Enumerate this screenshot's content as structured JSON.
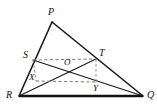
{
  "figure": {
    "background_color": "#ffffff",
    "stroke_color": "#1a1a1a",
    "dash_color": "#7a7a7a",
    "width": 157,
    "height": 105
  },
  "labels": {
    "P": "P",
    "Q": "Q",
    "R": "R",
    "S": "S",
    "T": "T",
    "O": "O",
    "X": "X",
    "Y": "Y"
  },
  "points": {
    "P": {
      "x": 52,
      "y": 22
    },
    "Q": {
      "x": 143,
      "y": 96
    },
    "R": {
      "x": 19,
      "y": 96
    },
    "S": {
      "x": 33,
      "y": 60
    },
    "T": {
      "x": 96,
      "y": 59
    },
    "O": {
      "x": 67,
      "y": 67
    },
    "X": {
      "x": 36,
      "y": 81
    },
    "Y": {
      "x": 96,
      "y": 82
    }
  },
  "label_positions": {
    "P": {
      "x": 48,
      "y": 15
    },
    "Q": {
      "x": 147,
      "y": 98
    },
    "R": {
      "x": 6,
      "y": 98
    },
    "S": {
      "x": 23,
      "y": 58
    },
    "T": {
      "x": 99,
      "y": 56
    },
    "O": {
      "x": 64,
      "y": 65
    },
    "X": {
      "x": 29,
      "y": 80
    },
    "Y": {
      "x": 93,
      "y": 91
    }
  },
  "segments": [
    {
      "name": "PR",
      "from": "P",
      "to": "R",
      "style": "solid"
    },
    {
      "name": "PQ",
      "from": "P",
      "to": "Q",
      "style": "solid"
    },
    {
      "name": "RQ",
      "from": "R",
      "to": "Q",
      "style": "base"
    },
    {
      "name": "RT",
      "from": "R",
      "to": "T",
      "style": "thin"
    },
    {
      "name": "SQ",
      "from": "S",
      "to": "Q",
      "style": "thin"
    },
    {
      "name": "ST",
      "from": "S",
      "to": "T",
      "style": "dashed"
    },
    {
      "name": "XY",
      "from": "X",
      "to": "Y",
      "style": "dashed"
    },
    {
      "name": "SX",
      "from": "S",
      "to": "X",
      "style": "dashed-v"
    },
    {
      "name": "TY",
      "from": "T",
      "to": "Y",
      "style": "dashed-v"
    }
  ]
}
